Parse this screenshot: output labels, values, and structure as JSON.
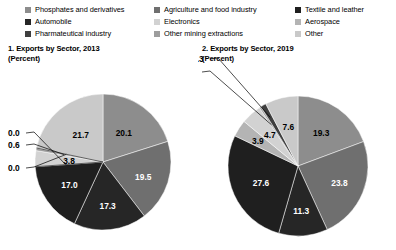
{
  "legend": {
    "columns": [
      [
        {
          "label": "Phosphates and derivatives",
          "color": "#8d8d8d"
        },
        {
          "label": "Automobile",
          "color": "#262626"
        },
        {
          "label": "Pharmateutical industry",
          "color": "#3f3f3f"
        }
      ],
      [
        {
          "label": "Agriculture and food industry",
          "color": "#6f6f6f"
        },
        {
          "label": "Electronics",
          "color": "#d2d2d2"
        },
        {
          "label": "Other mining extractions",
          "color": "#9d9d9d"
        }
      ],
      [
        {
          "label": "Textile and leather",
          "color": "#1f1f1f"
        },
        {
          "label": "Aerospace",
          "color": "#b4b4b4"
        },
        {
          "label": "Other",
          "color": "#c9c9c9"
        }
      ]
    ]
  },
  "charts": [
    {
      "title_line1": "1. Exports by Sector, 2013",
      "title_line2": "(Percent)"
    },
    {
      "title_line1": "2. Exports by Sector, 2019",
      "title_line2": "(Percent)"
    }
  ],
  "chart_data": [
    {
      "type": "pie",
      "title": "1. Exports by Sector, 2013",
      "subtitle": "(Percent)",
      "unit": "percent",
      "legend_position": "top",
      "categories": [
        "Phosphates and derivatives",
        "Agriculture and food industry",
        "Automobile",
        "Textile and leather",
        "Aerospace",
        "Electronics",
        "Other mining extractions",
        "Pharmateutical industry",
        "Other"
      ],
      "values": [
        20.1,
        19.5,
        17.3,
        17.0,
        0.0,
        3.8,
        0.6,
        0.0,
        21.7
      ],
      "labels": [
        "20.1",
        "19.5",
        "17.3",
        "17.0",
        "0.0",
        "3.8",
        "0.6",
        "0.0",
        "21.7"
      ],
      "colors": [
        "#8d8d8d",
        "#6f6f6f",
        "#262626",
        "#1f1f1f",
        "#b4b4b4",
        "#d2d2d2",
        "#9d9d9d",
        "#3f3f3f",
        "#c9c9c9"
      ]
    },
    {
      "type": "pie",
      "title": "2. Exports by Sector, 2019",
      "subtitle": "(Percent)",
      "unit": "percent",
      "legend_position": "top",
      "categories": [
        "Phosphates and derivatives",
        "Agriculture and food industry",
        "Automobile",
        "Textile and leather",
        "Aerospace",
        "Electronics",
        "Other mining extractions",
        "Pharmateutical industry",
        "Other"
      ],
      "values": [
        19.3,
        23.8,
        11.3,
        27.6,
        3.9,
        4.7,
        0.4,
        1.3,
        7.6
      ],
      "labels": [
        "19.3",
        "23.8",
        "11.3",
        "27.6",
        "3.9",
        "4.7",
        "0.4",
        "1.3",
        "7.6"
      ],
      "colors": [
        "#8d8d8d",
        "#6f6f6f",
        "#262626",
        "#1f1f1f",
        "#b4b4b4",
        "#d2d2d2",
        "#9d9d9d",
        "#3f3f3f",
        "#c9c9c9"
      ]
    }
  ]
}
